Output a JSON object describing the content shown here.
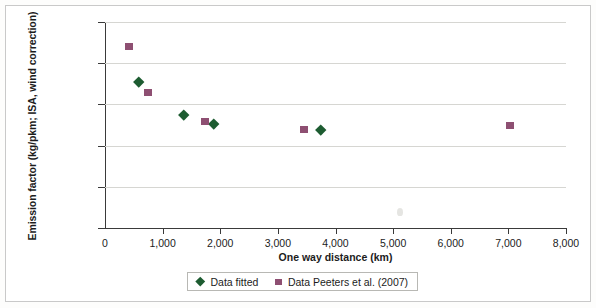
{
  "chart_data": {
    "type": "scatter",
    "title": "",
    "xlabel": "One way distance (km)",
    "ylabel": "Emission factor (kg/pkm; ISA, wind correction)",
    "xlim": [
      0,
      8000
    ],
    "ylim": [
      0,
      0.25
    ],
    "grid": true,
    "legend_position": "bottom",
    "xticks": [
      0,
      1000,
      2000,
      3000,
      4000,
      5000,
      6000,
      7000,
      8000
    ],
    "xtick_labels": [
      "0",
      "1,000",
      "2,000",
      "3,000",
      "4,000",
      "5,000",
      "6,000",
      "7,000",
      "8,000"
    ],
    "yticks": [
      0,
      0.05,
      0.1,
      0.15,
      0.2,
      0.25
    ],
    "ytick_labels": [
      "0",
      "0,05",
      "0,10",
      "0,15",
      "0,20",
      "0,25"
    ],
    "series": [
      {
        "name": "Data fitted",
        "marker": "diamond",
        "color": "#1d5c31",
        "points": [
          {
            "x": 590,
            "y": 0.178
          },
          {
            "x": 1370,
            "y": 0.138
          },
          {
            "x": 1895,
            "y": 0.127
          },
          {
            "x": 3750,
            "y": 0.119
          }
        ]
      },
      {
        "name": "Data Peeters et al. (2007)",
        "marker": "square",
        "color": "#8e4f72",
        "points": [
          {
            "x": 420,
            "y": 0.22
          },
          {
            "x": 745,
            "y": 0.164
          },
          {
            "x": 1735,
            "y": 0.129
          },
          {
            "x": 3455,
            "y": 0.119
          },
          {
            "x": 7030,
            "y": 0.124
          }
        ]
      }
    ]
  },
  "legend": {
    "items": [
      {
        "label": "Data fitted",
        "marker": "diamond"
      },
      {
        "label": "Data Peeters et al. (2007)",
        "marker": "square"
      }
    ]
  }
}
